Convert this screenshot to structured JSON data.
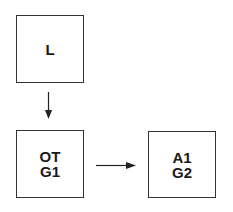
{
  "diagram": {
    "nodes": [
      {
        "id": "L",
        "lines": [
          "L"
        ],
        "x": 16,
        "y": 15,
        "w": 68,
        "h": 68
      },
      {
        "id": "OT",
        "lines": [
          "OT",
          "G1"
        ],
        "x": 16,
        "y": 130,
        "w": 68,
        "h": 68
      },
      {
        "id": "A1",
        "lines": [
          "A1",
          "G2"
        ],
        "x": 148,
        "y": 131,
        "w": 68,
        "h": 67
      }
    ],
    "edges": [
      {
        "from": "L",
        "to": "OT",
        "direction": "down"
      },
      {
        "from": "OT",
        "to": "A1",
        "direction": "right"
      }
    ],
    "colors": {
      "stroke": "#333333",
      "text": "#1a1a1a",
      "background": "#ffffff"
    }
  }
}
